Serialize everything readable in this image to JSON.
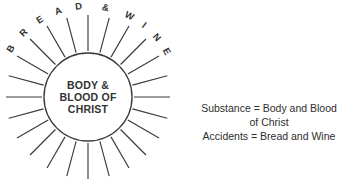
{
  "figure": {
    "colors": {
      "background": "#ffffff",
      "line": "#3a3a3a",
      "text": "#333333",
      "caption_text": "#2e2e2e"
    }
  },
  "host": {
    "lines": [
      "BODY &",
      "BLOOD OF",
      "CHRIST"
    ],
    "center": {
      "x": 88,
      "y": 97
    },
    "radius": 44
  },
  "rays": {
    "count": 24,
    "inner_radius": 46,
    "outer_radius": 82,
    "step_degrees": 15
  },
  "arc_label": {
    "text": "BREAD & WINE",
    "letters": [
      {
        "char": "B",
        "angle": -58
      },
      {
        "char": "R",
        "angle": -45
      },
      {
        "char": "E",
        "angle": -32
      },
      {
        "char": "A",
        "angle": -19
      },
      {
        "char": "D",
        "angle": -6
      },
      {
        "char": "&",
        "angle": 11
      },
      {
        "char": "W",
        "angle": 27
      },
      {
        "char": "I",
        "angle": 38
      },
      {
        "char": "N",
        "angle": 49
      },
      {
        "char": "E",
        "angle": 60
      }
    ],
    "radius": 88
  },
  "caption": {
    "lines": [
      "Substance = Body and Blood",
      "of Christ",
      "Accidents = Bread and Wine"
    ],
    "center_x": 269,
    "first_baseline_y": 112,
    "line_height": 14
  }
}
